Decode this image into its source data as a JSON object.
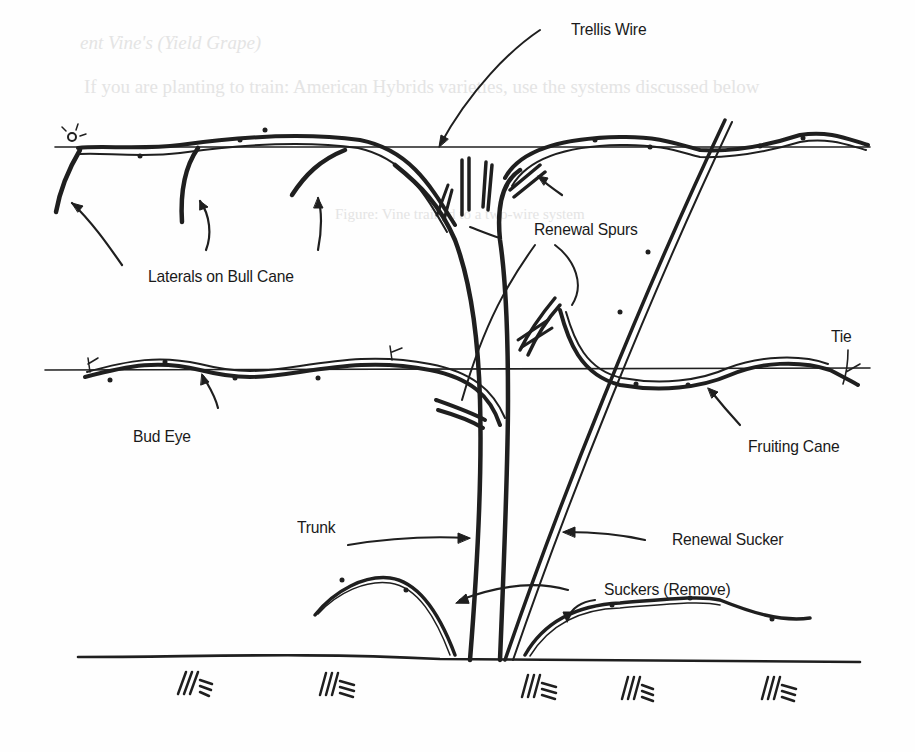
{
  "diagram": {
    "colors": {
      "ink": "#1f1f1f",
      "paper": "#fefefe",
      "bleed_through": "#e4e4e4"
    },
    "labels": {
      "trellis_wire": "Trellis Wire",
      "renewal_spurs": "Renewal Spurs",
      "laterals_on_bull_cane": "Laterals on Bull Cane",
      "tie": "Tie",
      "bud_eye": "Bud Eye",
      "fruiting_cane": "Fruiting Cane",
      "trunk": "Trunk",
      "renewal_sucker": "Renewal Sucker",
      "suckers_remove": "Suckers (Remove)"
    },
    "ground_symbol": "///≡",
    "ground_symbol_count": 6
  },
  "bleed_through": {
    "line1": "ent Vine's (Yield Grape)",
    "line2": "If you are planting to train: American Hybrids varieties, use the systems discussed below",
    "line3": "Figure: Vine trained to a two-wire system"
  }
}
